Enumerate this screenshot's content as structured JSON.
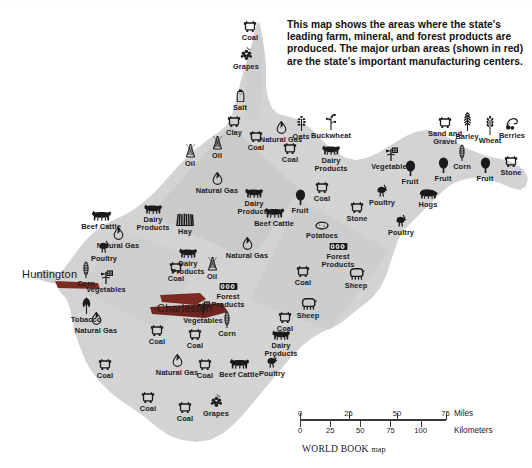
{
  "caption": {
    "text": "This map shows the areas where the state's leading farm, mineral, and forest products are produced. The major urban areas (shown in red) are the state's important manufacturing centers."
  },
  "cities": [
    {
      "name": "Huntington",
      "x": 22,
      "y": 268
    },
    {
      "name": "Charleston",
      "x": 157,
      "y": 302
    }
  ],
  "colors": {
    "land": "#d4d4d4",
    "land_shadow": "#bdbdbd",
    "background": "#ffffff",
    "symbol": "#1a1a1a",
    "urban_red": "#8a2a22",
    "scale_rule": "#3a3a3a"
  },
  "scale": {
    "miles_label": "Miles",
    "kilometers_label": "Kilometers",
    "miles_ticks": [
      "0",
      "25",
      "50",
      "75"
    ],
    "kilometers_ticks": [
      "0",
      "25",
      "50",
      "75",
      "100"
    ]
  },
  "credit": {
    "main": "WORLD BOOK",
    "suffix": "map"
  },
  "symbols": [
    {
      "label": "Coal",
      "icon": "coal-cart-icon",
      "x": 250,
      "y": 37,
      "ax": 0,
      "ay": 0
    },
    {
      "label": "Grapes",
      "icon": "grapes-icon",
      "x": 246,
      "y": 63,
      "ax": 0,
      "ay": 0
    },
    {
      "label": "Salt",
      "icon": "salt-shaker-icon",
      "x": 240,
      "y": 105,
      "ax": 0,
      "ay": 0
    },
    {
      "label": "Clay",
      "icon": "coal-cart-icon",
      "x": 234,
      "y": 132,
      "ax": 0,
      "ay": 0
    },
    {
      "label": "Coal",
      "icon": "coal-cart-icon",
      "x": 256,
      "y": 147,
      "ax": 0,
      "ay": 0
    },
    {
      "label": "Natural Gas",
      "icon": "gas-flame-icon",
      "x": 281,
      "y": 137,
      "ax": 0,
      "ay": 0
    },
    {
      "label": "Oats",
      "icon": "oats-icon",
      "x": 301,
      "y": 132,
      "ax": 0,
      "ay": 0
    },
    {
      "label": "Buckwheat",
      "icon": "buckwheat-icon",
      "x": 331,
      "y": 130,
      "ax": 0,
      "ay": 0
    },
    {
      "label": "Oil",
      "icon": "oil-derrick-icon",
      "x": 190,
      "y": 160,
      "ax": 0,
      "ay": 0
    },
    {
      "label": "Oil",
      "icon": "oil-derrick-icon",
      "x": 217,
      "y": 152,
      "ax": 0,
      "ay": 0
    },
    {
      "label": "Natural Gas",
      "icon": "gas-flame-icon",
      "x": 217,
      "y": 188,
      "ax": 0,
      "ay": 0
    },
    {
      "label": "Coal",
      "icon": "coal-cart-icon",
      "x": 290,
      "y": 159,
      "ax": 0,
      "ay": 0
    },
    {
      "label": "Dairy Products",
      "icon": "dairy-cow-icon",
      "x": 331,
      "y": 160,
      "ax": 0,
      "ay": 0
    },
    {
      "label": "Vegetables",
      "icon": "vegetables-icon",
      "x": 391,
      "y": 162,
      "ax": 0,
      "ay": 0
    },
    {
      "label": "Sand and Gravel",
      "icon": "coal-cart-icon",
      "x": 445,
      "y": 133,
      "ax": 0,
      "ay": 0
    },
    {
      "label": "Barley",
      "icon": "barley-icon",
      "x": 467,
      "y": 128,
      "ax": 0,
      "ay": 0
    },
    {
      "label": "Wheat",
      "icon": "wheat-icon",
      "x": 490,
      "y": 132,
      "ax": 0,
      "ay": 0
    },
    {
      "label": "Berries",
      "icon": "berries-icon",
      "x": 512,
      "y": 133,
      "ax": 0,
      "ay": 0
    },
    {
      "label": "Corn",
      "icon": "corn-icon",
      "x": 462,
      "y": 160,
      "ax": 0,
      "ay": 0
    },
    {
      "label": "Fruit",
      "icon": "fruit-tree-icon",
      "x": 443,
      "y": 173,
      "ax": 0,
      "ay": 0
    },
    {
      "label": "Fruit",
      "icon": "fruit-tree-icon",
      "x": 485,
      "y": 173,
      "ax": 0,
      "ay": 0
    },
    {
      "label": "Stone",
      "icon": "coal-cart-icon",
      "x": 511,
      "y": 172,
      "ax": 0,
      "ay": 0
    },
    {
      "label": "Fruit",
      "icon": "fruit-tree-icon",
      "x": 410,
      "y": 176,
      "ax": 0,
      "ay": 0
    },
    {
      "label": "Hogs",
      "icon": "hog-icon",
      "x": 428,
      "y": 204,
      "ax": 0,
      "ay": 0
    },
    {
      "label": "Poultry",
      "icon": "poultry-icon",
      "x": 382,
      "y": 200,
      "ax": 0,
      "ay": 0
    },
    {
      "label": "Poultry",
      "icon": "poultry-icon",
      "x": 401,
      "y": 230,
      "ax": 0,
      "ay": 0
    },
    {
      "label": "Coal",
      "icon": "coal-cart-icon",
      "x": 322,
      "y": 198,
      "ax": 0,
      "ay": 0
    },
    {
      "label": "Dairy Products",
      "icon": "dairy-cow-icon",
      "x": 254,
      "y": 203,
      "ax": 0,
      "ay": 0
    },
    {
      "label": "Fruit",
      "icon": "fruit-tree-icon",
      "x": 300,
      "y": 205,
      "ax": 0,
      "ay": 0
    },
    {
      "label": "Beef Cattle",
      "icon": "beef-cattle-icon",
      "x": 274,
      "y": 222,
      "ax": 0,
      "ay": 0
    },
    {
      "label": "Stone",
      "icon": "coal-cart-icon",
      "x": 357,
      "y": 218,
      "ax": 0,
      "ay": 0
    },
    {
      "label": "Potatoes",
      "icon": "potato-icon",
      "x": 322,
      "y": 237,
      "ax": 0,
      "ay": 0
    },
    {
      "label": "Forest Products",
      "icon": "lumber-icon",
      "x": 338,
      "y": 258,
      "ax": 0,
      "ay": 0
    },
    {
      "label": "Dairy Products",
      "icon": "dairy-cow-icon",
      "x": 153,
      "y": 219,
      "ax": 0,
      "ay": 0
    },
    {
      "label": "Hay",
      "icon": "hay-icon",
      "x": 185,
      "y": 229,
      "ax": 0,
      "ay": 0
    },
    {
      "label": "Beef Cattle",
      "icon": "beef-cattle-icon",
      "x": 101,
      "y": 225,
      "ax": 0,
      "ay": 0
    },
    {
      "label": "Natural Gas",
      "icon": "gas-flame-icon",
      "x": 118,
      "y": 243,
      "ax": 0,
      "ay": 0
    },
    {
      "label": "Poultry",
      "icon": "poultry-icon",
      "x": 104,
      "y": 256,
      "ax": 0,
      "ay": 0
    },
    {
      "label": "Corn",
      "icon": "corn-icon",
      "x": 86,
      "y": 277,
      "ax": 0,
      "ay": 0
    },
    {
      "label": "Vegetables",
      "icon": "vegetables-icon",
      "x": 106,
      "y": 285,
      "ax": 0,
      "ay": 0
    },
    {
      "label": "Tobacco",
      "icon": "tobacco-icon",
      "x": 86,
      "y": 313,
      "ax": 0,
      "ay": 0
    },
    {
      "label": "Natural Gas",
      "icon": "gas-flame-icon",
      "x": 96,
      "y": 328,
      "ax": 0,
      "ay": 0
    },
    {
      "label": "Natural Gas",
      "icon": "gas-flame-icon",
      "x": 247,
      "y": 253,
      "ax": 0,
      "ay": 0
    },
    {
      "label": "Oil",
      "icon": "oil-derrick-icon",
      "x": 212,
      "y": 273,
      "ax": 0,
      "ay": 0
    },
    {
      "label": "Dairy Products",
      "icon": "dairy-cow-icon",
      "x": 188,
      "y": 263,
      "ax": 0,
      "ay": 0
    },
    {
      "label": "Coal",
      "icon": "coal-cart-icon",
      "x": 176,
      "y": 278,
      "ax": 0,
      "ay": 0
    },
    {
      "label": "Coal",
      "icon": "coal-cart-icon",
      "x": 303,
      "y": 282,
      "ax": 0,
      "ay": 0
    },
    {
      "label": "Forest Products",
      "icon": "lumber-icon",
      "x": 228,
      "y": 298,
      "ax": 0,
      "ay": 0
    },
    {
      "label": "Sheep",
      "icon": "sheep-icon",
      "x": 356,
      "y": 284,
      "ax": 0,
      "ay": 0
    },
    {
      "label": "Sheep",
      "icon": "sheep-icon",
      "x": 308,
      "y": 314,
      "ax": 0,
      "ay": 0
    },
    {
      "label": "Vegetables",
      "icon": "vegetables-icon",
      "x": 203,
      "y": 316,
      "ax": 0,
      "ay": 0
    },
    {
      "label": "Corn",
      "icon": "corn-icon",
      "x": 227,
      "y": 327,
      "ax": 0,
      "ay": 0
    },
    {
      "label": "Coal",
      "icon": "coal-cart-icon",
      "x": 157,
      "y": 341,
      "ax": 0,
      "ay": 0
    },
    {
      "label": "Coal",
      "icon": "coal-cart-icon",
      "x": 195,
      "y": 345,
      "ax": 0,
      "ay": 0
    },
    {
      "label": "Coal",
      "icon": "coal-cart-icon",
      "x": 285,
      "y": 328,
      "ax": 0,
      "ay": 0
    },
    {
      "label": "Dairy Products",
      "icon": "dairy-cow-icon",
      "x": 281,
      "y": 345,
      "ax": 0,
      "ay": 0
    },
    {
      "label": "Poultry",
      "icon": "poultry-icon",
      "x": 272,
      "y": 371,
      "ax": 0,
      "ay": 0
    },
    {
      "label": "Beef Cattle",
      "icon": "beef-cattle-icon",
      "x": 239,
      "y": 373,
      "ax": 0,
      "ay": 0
    },
    {
      "label": "Natural Gas",
      "icon": "gas-flame-icon",
      "x": 177,
      "y": 370,
      "ax": 0,
      "ay": 0
    },
    {
      "label": "Coal",
      "icon": "coal-cart-icon",
      "x": 205,
      "y": 375,
      "ax": 0,
      "ay": 0
    },
    {
      "label": "Coal",
      "icon": "coal-cart-icon",
      "x": 105,
      "y": 375,
      "ax": 0,
      "ay": 0
    },
    {
      "label": "Coal",
      "icon": "coal-cart-icon",
      "x": 148,
      "y": 408,
      "ax": 0,
      "ay": 0
    },
    {
      "label": "Coal",
      "icon": "coal-cart-icon",
      "x": 185,
      "y": 418,
      "ax": 0,
      "ay": 0
    },
    {
      "label": "Grapes",
      "icon": "grapes-icon",
      "x": 216,
      "y": 410,
      "ax": 0,
      "ay": 0
    }
  ]
}
